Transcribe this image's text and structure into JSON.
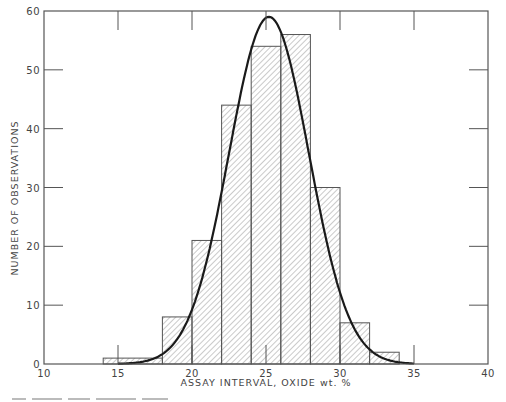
{
  "chart_data": {
    "type": "bar",
    "subtype": "histogram-with-normal-curve",
    "title": "",
    "xlabel": "ASSAY INTERVAL, OXIDE wt. %",
    "ylabel": "NUMBER OF OBSERVATIONS",
    "xlim": [
      10,
      40
    ],
    "ylim": [
      0,
      60
    ],
    "x_ticks": [
      10,
      15,
      20,
      25,
      30,
      35,
      40
    ],
    "y_ticks": [
      0,
      10,
      20,
      30,
      40,
      50,
      60
    ],
    "grid": false,
    "legend": null,
    "bins": [
      {
        "from": 14,
        "to": 18,
        "count": 1
      },
      {
        "from": 18,
        "to": 20,
        "count": 8
      },
      {
        "from": 20,
        "to": 22,
        "count": 21
      },
      {
        "from": 22,
        "to": 24,
        "count": 44
      },
      {
        "from": 24,
        "to": 26,
        "count": 54
      },
      {
        "from": 26,
        "to": 28,
        "count": 56
      },
      {
        "from": 28,
        "to": 30,
        "count": 30
      },
      {
        "from": 30,
        "to": 32,
        "count": 7
      },
      {
        "from": 32,
        "to": 34,
        "count": 2
      }
    ],
    "categories": [
      "14-18",
      "18-20",
      "20-22",
      "22-24",
      "24-26",
      "26-28",
      "28-30",
      "30-32",
      "32-34"
    ],
    "values": [
      1,
      8,
      21,
      44,
      54,
      56,
      30,
      7,
      2
    ],
    "fitted_curve": {
      "type": "normal",
      "mean": 25.2,
      "peak": 59,
      "sigma": 2.7,
      "x_range": [
        15,
        35
      ]
    },
    "colors": {
      "axis": "#555555",
      "bar_edge": "#555555",
      "hatch": "#888888",
      "curve": "#1a1a1a"
    }
  }
}
